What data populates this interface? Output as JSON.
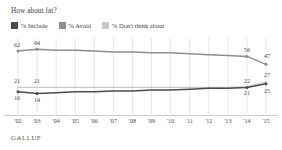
{
  "title": "How about fat?",
  "source": "GALLUP",
  "legend": [
    {
      "label": "% Include",
      "color": "#4c4c4c",
      "icon": "legend-swatch"
    },
    {
      "label": "% Avoid",
      "color": "#8e8e8e",
      "icon": "legend-swatch"
    },
    {
      "label": "% Don't think about",
      "color": "#c9c9c9",
      "icon": "legend-swatch"
    }
  ],
  "chart_data": {
    "type": "line",
    "title": "How about fat?",
    "xlabel": "",
    "ylabel": "",
    "ylim": [
      0,
      70
    ],
    "grid": "vertical",
    "legend_position": "top-left",
    "categories": [
      "'02",
      "'03",
      "'04",
      "'05",
      "'06",
      "'07",
      "'08",
      "'09",
      "'10",
      "'11",
      "'12",
      "'13",
      "'14",
      "'15"
    ],
    "series": [
      {
        "name": "% Avoid",
        "color": "#8e8e8e",
        "values": [
          62,
          64,
          63,
          63,
          62,
          61,
          61,
          60,
          60,
          59,
          58,
          57,
          56,
          47
        ],
        "labels": {
          "0": "62",
          "1": "64",
          "12": "56",
          "13": "47"
        }
      },
      {
        "name": "% Don't think about",
        "color": "#c9c9c9",
        "values": [
          21,
          21,
          21,
          21,
          21,
          21,
          21,
          21,
          21,
          21,
          21,
          21,
          22,
          27
        ],
        "labels": {
          "0": "21",
          "1": "21",
          "12": "22",
          "13": "27"
        }
      },
      {
        "name": "% Include",
        "color": "#4c4c4c",
        "values": [
          16,
          14,
          15,
          16,
          16,
          17,
          17,
          18,
          18,
          19,
          20,
          20,
          21,
          25
        ],
        "labels": {
          "0": "16",
          "1": "14",
          "12": "21",
          "13": "25"
        }
      }
    ]
  }
}
